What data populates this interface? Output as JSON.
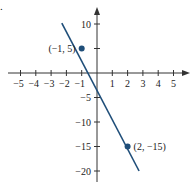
{
  "part_label": ".",
  "chart_data": {
    "type": "line",
    "title": "",
    "xlabel": "",
    "ylabel": "",
    "xlim": [
      -5.5,
      5.8
    ],
    "ylim": [
      -22,
      13
    ],
    "grid": false,
    "colors": {
      "line": "#1f4e79",
      "axis": "#333333"
    },
    "x_ticks": [
      -5,
      -4,
      -3,
      -2,
      -1,
      1,
      2,
      3,
      4,
      5
    ],
    "x_tick_labels": [
      "−5",
      "−4",
      "−3",
      "−2",
      "−1",
      "1",
      "2",
      "3",
      "4",
      "5"
    ],
    "y_ticks": [
      10,
      5,
      -5,
      -10,
      -15,
      -20
    ],
    "y_tick_labels": [
      "10",
      "5",
      "−5",
      "−10",
      "−15",
      "−20"
    ],
    "y_labeled_ticks": [
      "10",
      "−5",
      "−10",
      "−15",
      "−20"
    ],
    "series": [
      {
        "name": "y = -4x + 1",
        "x": [
          -2.3,
          2.75
        ],
        "y": [
          10.2,
          -20
        ]
      }
    ],
    "points": [
      {
        "x": -1,
        "y": 5,
        "label": "(−1, 5)",
        "label_side": "left"
      },
      {
        "x": 2,
        "y": -15,
        "label": "(2, −15)",
        "label_side": "right"
      }
    ]
  }
}
